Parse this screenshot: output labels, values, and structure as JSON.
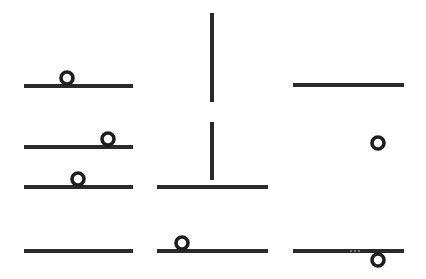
{
  "board": {
    "width": 426,
    "height": 279,
    "background": "#ffffff",
    "stroke_color": "#2a2a2a",
    "cells": [
      {
        "id": "r1c1",
        "type": "horizontal-with-ring",
        "line": {
          "x1": 24,
          "y1": 86,
          "x2": 133,
          "y2": 86
        },
        "ring": {
          "cx": 67,
          "cy": 77,
          "r": 6
        }
      },
      {
        "id": "r1c2",
        "type": "vertical",
        "line": {
          "x1": 212,
          "y1": 13,
          "x2": 212,
          "y2": 102
        }
      },
      {
        "id": "r1c3",
        "type": "horizontal",
        "line": {
          "x1": 293,
          "y1": 85,
          "x2": 404,
          "y2": 85
        }
      },
      {
        "id": "r2c1a",
        "type": "horizontal-with-ring",
        "line": {
          "x1": 24,
          "y1": 147,
          "x2": 133,
          "y2": 147
        },
        "ring": {
          "cx": 108,
          "cy": 138,
          "r": 6
        }
      },
      {
        "id": "r2c1b",
        "type": "horizontal-with-ring",
        "line": {
          "x1": 24,
          "y1": 187,
          "x2": 133,
          "y2": 187
        },
        "ring": {
          "cx": 78,
          "cy": 178,
          "r": 6
        }
      },
      {
        "id": "r2c2",
        "type": "t-shape",
        "line": {
          "x1": 157,
          "y1": 187,
          "x2": 268,
          "y2": 187
        },
        "stem": {
          "x1": 212,
          "y1": 122,
          "x2": 212,
          "y2": 180
        }
      },
      {
        "id": "r2c3",
        "type": "ring-only",
        "ring": {
          "cx": 378,
          "cy": 143,
          "r": 6
        }
      },
      {
        "id": "r3c1",
        "type": "horizontal",
        "line": {
          "x1": 24,
          "y1": 251,
          "x2": 133,
          "y2": 251
        }
      },
      {
        "id": "r3c2",
        "type": "horizontal-with-ring",
        "line": {
          "x1": 157,
          "y1": 251,
          "x2": 268,
          "y2": 251
        },
        "ring": {
          "cx": 182,
          "cy": 242,
          "r": 6
        }
      },
      {
        "id": "r3c3",
        "type": "horizontal-with-ring-below",
        "line": {
          "x1": 293,
          "y1": 251,
          "x2": 404,
          "y2": 251
        },
        "ring": {
          "cx": 378,
          "cy": 260,
          "r": 6
        },
        "dots_label": "..."
      }
    ]
  }
}
